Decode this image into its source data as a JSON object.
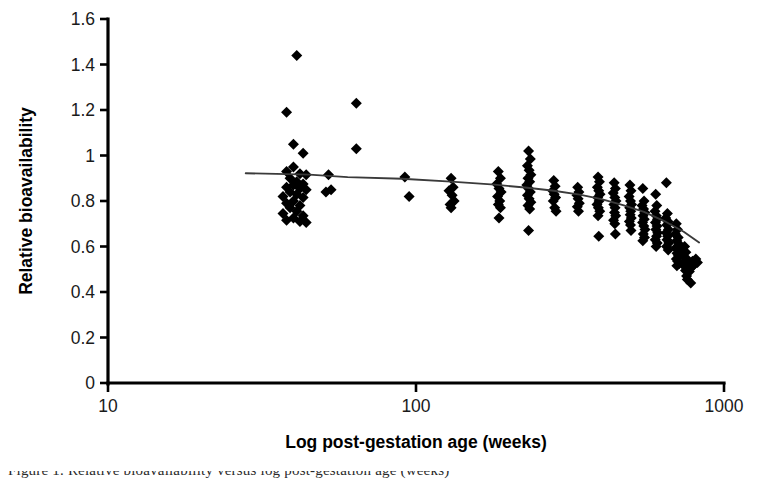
{
  "figure": {
    "background_color": "#ffffff",
    "marker_color": "#000000",
    "trendline_color": "#3a3a3a",
    "axis_color": "#000000",
    "partial_caption": "Figure 1. Relative bioavailability versus log post-gestation age (weeks)"
  },
  "chart_data": {
    "type": "scatter",
    "title": "",
    "xlabel": "Log post-gestation age (weeks)",
    "ylabel": "Relative bioavailability",
    "xscale": "log",
    "yscale": "linear",
    "xlim": [
      10,
      1000
    ],
    "ylim": [
      0,
      1.6
    ],
    "xticks": [
      10,
      100,
      1000
    ],
    "xticklabels": [
      "10",
      "100",
      "1000"
    ],
    "yticks": [
      0,
      0.2,
      0.4,
      0.6,
      0.8,
      1,
      1.2,
      1.4,
      1.6
    ],
    "yticklabels": [
      "0",
      "0.2",
      "0.4",
      "0.6",
      "0.8",
      "1",
      "1.2",
      "1.4",
      "1.6"
    ],
    "grid": false,
    "legend": false,
    "marker": "diamond",
    "marker_size_px": 11,
    "points": [
      [
        38,
        1.19
      ],
      [
        41,
        1.44
      ],
      [
        40,
        1.05
      ],
      [
        43,
        1.01
      ],
      [
        40,
        0.95
      ],
      [
        38,
        0.93
      ],
      [
        42,
        0.92
      ],
      [
        44,
        0.915
      ],
      [
        39,
        0.9
      ],
      [
        41,
        0.885
      ],
      [
        43,
        0.875
      ],
      [
        40,
        0.87
      ],
      [
        38,
        0.86
      ],
      [
        42,
        0.855
      ],
      [
        44,
        0.85
      ],
      [
        39,
        0.84
      ],
      [
        41,
        0.83
      ],
      [
        37,
        0.82
      ],
      [
        43,
        0.815
      ],
      [
        40,
        0.8
      ],
      [
        38,
        0.79
      ],
      [
        42,
        0.78
      ],
      [
        39,
        0.77
      ],
      [
        41,
        0.755
      ],
      [
        37,
        0.745
      ],
      [
        43,
        0.735
      ],
      [
        40,
        0.725
      ],
      [
        38,
        0.715
      ],
      [
        42,
        0.71
      ],
      [
        44,
        0.705
      ],
      [
        52,
        0.915
      ],
      [
        53,
        0.85
      ],
      [
        51,
        0.84
      ],
      [
        64,
        1.23
      ],
      [
        64,
        1.03
      ],
      [
        92,
        0.905
      ],
      [
        95,
        0.82
      ],
      [
        130,
        0.9
      ],
      [
        132,
        0.86
      ],
      [
        128,
        0.845
      ],
      [
        131,
        0.825
      ],
      [
        133,
        0.8
      ],
      [
        129,
        0.785
      ],
      [
        130,
        0.77
      ],
      [
        185,
        0.93
      ],
      [
        188,
        0.9
      ],
      [
        183,
        0.875
      ],
      [
        186,
        0.855
      ],
      [
        189,
        0.84
      ],
      [
        184,
        0.82
      ],
      [
        187,
        0.8
      ],
      [
        185,
        0.785
      ],
      [
        188,
        0.77
      ],
      [
        186,
        0.725
      ],
      [
        232,
        1.02
      ],
      [
        235,
        0.985
      ],
      [
        230,
        0.955
      ],
      [
        233,
        0.935
      ],
      [
        236,
        0.915
      ],
      [
        231,
        0.9
      ],
      [
        234,
        0.885
      ],
      [
        229,
        0.87
      ],
      [
        232,
        0.855
      ],
      [
        235,
        0.84
      ],
      [
        230,
        0.825
      ],
      [
        233,
        0.81
      ],
      [
        236,
        0.795
      ],
      [
        231,
        0.78
      ],
      [
        234,
        0.765
      ],
      [
        232,
        0.67
      ],
      [
        280,
        0.89
      ],
      [
        283,
        0.865
      ],
      [
        278,
        0.845
      ],
      [
        281,
        0.83
      ],
      [
        284,
        0.815
      ],
      [
        279,
        0.8
      ],
      [
        282,
        0.77
      ],
      [
        285,
        0.755
      ],
      [
        335,
        0.86
      ],
      [
        338,
        0.84
      ],
      [
        333,
        0.825
      ],
      [
        336,
        0.81
      ],
      [
        339,
        0.79
      ],
      [
        334,
        0.775
      ],
      [
        337,
        0.755
      ],
      [
        390,
        0.905
      ],
      [
        394,
        0.885
      ],
      [
        388,
        0.86
      ],
      [
        392,
        0.845
      ],
      [
        396,
        0.83
      ],
      [
        389,
        0.815
      ],
      [
        393,
        0.8
      ],
      [
        387,
        0.785
      ],
      [
        391,
        0.77
      ],
      [
        395,
        0.755
      ],
      [
        390,
        0.735
      ],
      [
        392,
        0.645
      ],
      [
        440,
        0.88
      ],
      [
        444,
        0.855
      ],
      [
        437,
        0.835
      ],
      [
        442,
        0.815
      ],
      [
        446,
        0.8
      ],
      [
        439,
        0.785
      ],
      [
        443,
        0.77
      ],
      [
        441,
        0.75
      ],
      [
        445,
        0.735
      ],
      [
        438,
        0.715
      ],
      [
        442,
        0.7
      ],
      [
        444,
        0.655
      ],
      [
        495,
        0.87
      ],
      [
        499,
        0.845
      ],
      [
        492,
        0.82
      ],
      [
        497,
        0.8
      ],
      [
        501,
        0.785
      ],
      [
        494,
        0.77
      ],
      [
        498,
        0.755
      ],
      [
        496,
        0.74
      ],
      [
        500,
        0.725
      ],
      [
        493,
        0.71
      ],
      [
        497,
        0.695
      ],
      [
        499,
        0.67
      ],
      [
        545,
        0.855
      ],
      [
        550,
        0.8
      ],
      [
        542,
        0.78
      ],
      [
        548,
        0.765
      ],
      [
        553,
        0.75
      ],
      [
        546,
        0.735
      ],
      [
        551,
        0.72
      ],
      [
        544,
        0.705
      ],
      [
        549,
        0.69
      ],
      [
        554,
        0.675
      ],
      [
        547,
        0.655
      ],
      [
        552,
        0.64
      ],
      [
        545,
        0.625
      ],
      [
        600,
        0.83
      ],
      [
        605,
        0.78
      ],
      [
        597,
        0.755
      ],
      [
        603,
        0.735
      ],
      [
        608,
        0.72
      ],
      [
        599,
        0.705
      ],
      [
        606,
        0.69
      ],
      [
        601,
        0.675
      ],
      [
        609,
        0.66
      ],
      [
        604,
        0.645
      ],
      [
        598,
        0.63
      ],
      [
        607,
        0.615
      ],
      [
        602,
        0.6
      ],
      [
        650,
        0.88
      ],
      [
        655,
        0.745
      ],
      [
        647,
        0.725
      ],
      [
        658,
        0.71
      ],
      [
        652,
        0.695
      ],
      [
        660,
        0.675
      ],
      [
        649,
        0.66
      ],
      [
        656,
        0.645
      ],
      [
        653,
        0.63
      ],
      [
        662,
        0.615
      ],
      [
        651,
        0.6
      ],
      [
        659,
        0.585
      ],
      [
        700,
        0.7
      ],
      [
        706,
        0.675
      ],
      [
        695,
        0.655
      ],
      [
        710,
        0.64
      ],
      [
        702,
        0.625
      ],
      [
        715,
        0.61
      ],
      [
        698,
        0.595
      ],
      [
        708,
        0.585
      ],
      [
        704,
        0.57
      ],
      [
        712,
        0.56
      ],
      [
        700,
        0.545
      ],
      [
        707,
        0.535
      ],
      [
        716,
        0.525
      ],
      [
        703,
        0.515
      ],
      [
        718,
        0.58
      ],
      [
        745,
        0.6
      ],
      [
        752,
        0.575
      ],
      [
        740,
        0.555
      ],
      [
        758,
        0.545
      ],
      [
        748,
        0.535
      ],
      [
        762,
        0.525
      ],
      [
        744,
        0.515
      ],
      [
        755,
        0.505
      ],
      [
        750,
        0.495
      ],
      [
        765,
        0.53
      ],
      [
        770,
        0.5
      ],
      [
        756,
        0.47
      ],
      [
        760,
        0.455
      ],
      [
        775,
        0.52
      ],
      [
        785,
        0.51
      ],
      [
        772,
        0.49
      ],
      [
        790,
        0.535
      ],
      [
        800,
        0.52
      ],
      [
        780,
        0.44
      ],
      [
        810,
        0.545
      ],
      [
        820,
        0.53
      ]
    ],
    "trendline": {
      "name": "fitted trend",
      "x": [
        28,
        45,
        60,
        90,
        130,
        180,
        230,
        280,
        340,
        400,
        470,
        550,
        640,
        740,
        830
      ],
      "y": [
        0.922,
        0.916,
        0.905,
        0.898,
        0.885,
        0.872,
        0.858,
        0.845,
        0.828,
        0.808,
        0.782,
        0.752,
        0.712,
        0.665,
        0.618
      ]
    }
  }
}
